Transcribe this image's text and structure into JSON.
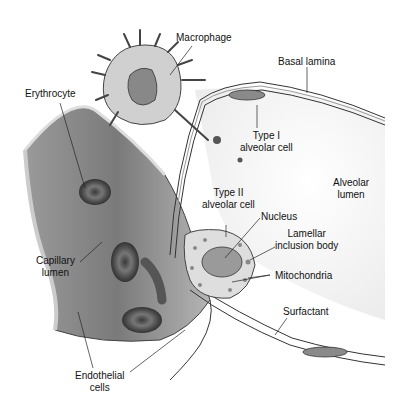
{
  "diagram": {
    "labels": {
      "macrophage": "Macrophage",
      "basal_lamina": "Basal lamina",
      "erythrocyte": "Erythrocyte",
      "type1_line1": "Type I",
      "type1_line2": "alveolar cell",
      "alveolar_lumen_line1": "Alveolar",
      "alveolar_lumen_line2": "lumen",
      "type2_line1": "Type II",
      "type2_line2": "alveolar cell",
      "nucleus": "Nucleus",
      "lamellar_line1": "Lamellar",
      "lamellar_line2": "inclusion body",
      "capillary_line1": "Capillary",
      "capillary_line2": "lumen",
      "mitochondria": "Mitochondria",
      "surfactant": "Surfactant",
      "endothelial_line1": "Endothelial",
      "endothelial_line2": "cells"
    },
    "colors": {
      "capillary": "#6e6e6e",
      "capillary_light": "#bdbdbd",
      "rbc": "#555555",
      "cell_fill": "#d9d9d9",
      "line": "#222222"
    }
  }
}
